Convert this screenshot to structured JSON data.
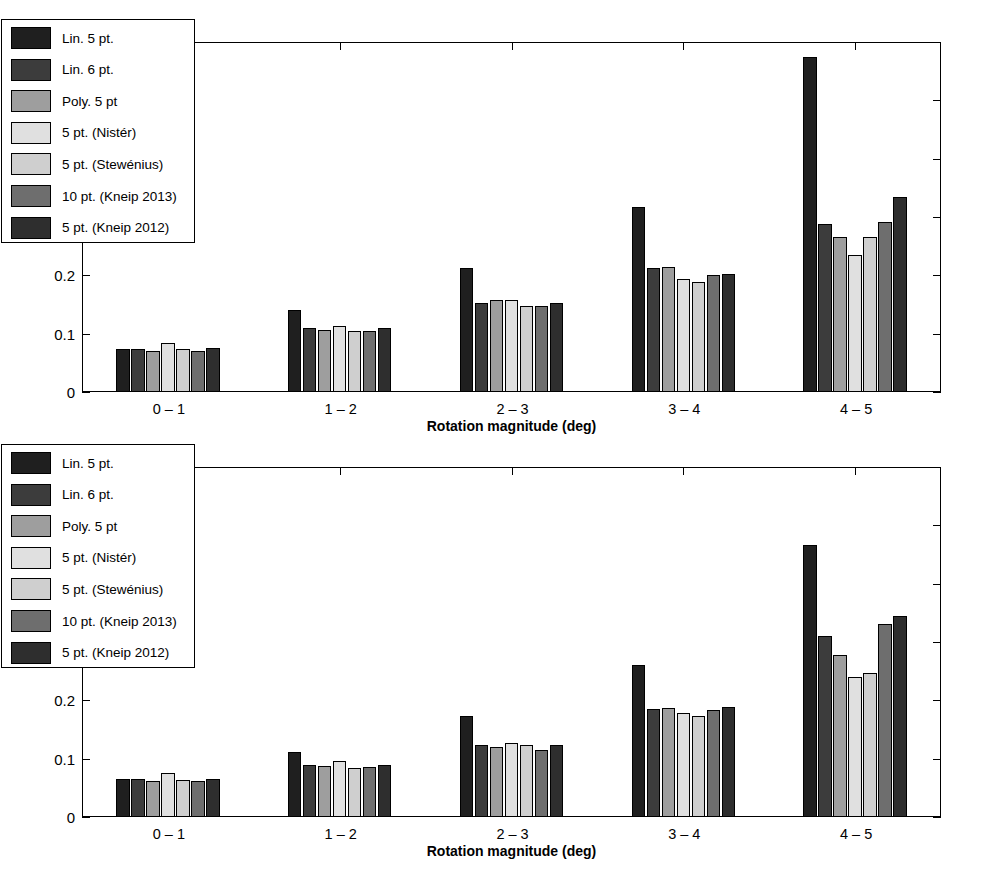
{
  "figure": {
    "background": "#ffffff",
    "panels": [
      "top",
      "bottom"
    ]
  },
  "series_colors": [
    "#1f1f1f",
    "#3c3c3c",
    "#9e9e9e",
    "#e0e0e0",
    "#cfcfcf",
    "#6e6e6e",
    "#2e2e2e"
  ],
  "legend": {
    "items": [
      {
        "label": "Lin. 5 pt.",
        "color": "#1f1f1f"
      },
      {
        "label": "Lin. 6 pt.",
        "color": "#3c3c3c"
      },
      {
        "label": "Poly. 5 pt",
        "color": "#9e9e9e"
      },
      {
        "label": "5 pt. (Nistér)",
        "color": "#e0e0e0"
      },
      {
        "label": "5 pt. (Stewénius)",
        "color": "#cfcfcf"
      },
      {
        "label": "10 pt. (Kneip 2013)",
        "color": "#6e6e6e"
      },
      {
        "label": "5 pt. (Kneip 2012)",
        "color": "#2e2e2e"
      }
    ]
  },
  "chart_data": [
    {
      "type": "bar",
      "panel": "top",
      "title": "",
      "xlabel": "Rotation magnitude (deg)",
      "ylabel": "Mean error (deg)",
      "categories": [
        "0 – 1",
        "1 – 2",
        "2 – 3",
        "3 – 4",
        "4 – 5"
      ],
      "ylim": [
        0,
        0.6
      ],
      "yticks": [
        0,
        0.1,
        0.2,
        0.3,
        0.4,
        0.5,
        0.6
      ],
      "ytick_labels": [
        "0",
        "0.1",
        "0.2",
        "0.3",
        "0.4",
        "0.5",
        "0.6"
      ],
      "grid": false,
      "legend_position": "upper left",
      "series": [
        {
          "name": "Lin. 5 pt.",
          "values": [
            0.074,
            0.141,
            0.213,
            0.318,
            0.574
          ]
        },
        {
          "name": "Lin. 6 pt.",
          "values": [
            0.074,
            0.11,
            0.152,
            0.212,
            0.288
          ]
        },
        {
          "name": "Poly. 5 pt",
          "values": [
            0.071,
            0.107,
            0.157,
            0.215,
            0.265
          ]
        },
        {
          "name": "5 pt. (Nistér)",
          "values": [
            0.084,
            0.114,
            0.157,
            0.194,
            0.235
          ]
        },
        {
          "name": "5 pt. (Stewénius)",
          "values": [
            0.073,
            0.104,
            0.147,
            0.188,
            0.265
          ]
        },
        {
          "name": "10 pt. (Kneip 2013)",
          "values": [
            0.07,
            0.104,
            0.148,
            0.2,
            0.292
          ]
        },
        {
          "name": "5 pt. (Kneip 2012)",
          "values": [
            0.075,
            0.11,
            0.153,
            0.203,
            0.335
          ]
        }
      ]
    },
    {
      "type": "bar",
      "panel": "bottom",
      "title": "",
      "xlabel": "Rotation magnitude (deg)",
      "ylabel": "Median error (deg)",
      "categories": [
        "0 – 1",
        "1 – 2",
        "2 – 3",
        "3 – 4",
        "4 – 5"
      ],
      "ylim": [
        0,
        0.6
      ],
      "yticks": [
        0,
        0.1,
        0.2,
        0.3,
        0.4,
        0.5,
        0.6
      ],
      "ytick_labels": [
        "0",
        "0.1",
        "0.2",
        "0.3",
        "0.4",
        "0.5",
        "0.6"
      ],
      "grid": false,
      "legend_position": "upper left",
      "series": [
        {
          "name": "Lin. 5 pt.",
          "values": [
            0.065,
            0.112,
            0.173,
            0.261,
            0.467
          ]
        },
        {
          "name": "Lin. 6 pt.",
          "values": [
            0.065,
            0.089,
            0.123,
            0.186,
            0.311
          ]
        },
        {
          "name": "Poly. 5 pt",
          "values": [
            0.062,
            0.087,
            0.12,
            0.187,
            0.277
          ]
        },
        {
          "name": "5 pt. (Nistér)",
          "values": [
            0.075,
            0.096,
            0.127,
            0.178,
            0.24
          ]
        },
        {
          "name": "5 pt. (Stewénius)",
          "values": [
            0.063,
            0.084,
            0.124,
            0.174,
            0.247
          ]
        },
        {
          "name": "10 pt. (Kneip 2013)",
          "values": [
            0.061,
            0.085,
            0.115,
            0.183,
            0.331
          ]
        },
        {
          "name": "5 pt. (Kneip 2012)",
          "values": [
            0.066,
            0.089,
            0.123,
            0.189,
            0.344
          ]
        }
      ]
    }
  ]
}
